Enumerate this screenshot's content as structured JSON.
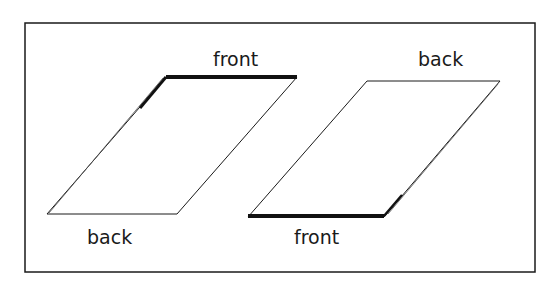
{
  "diagram": {
    "left_panel": {
      "top_label": "front",
      "bottom_label": "back"
    },
    "right_panel": {
      "top_label": "back",
      "bottom_label": "front"
    }
  },
  "colors": {
    "line": "#1a1a1a",
    "background": "#ffffff"
  }
}
